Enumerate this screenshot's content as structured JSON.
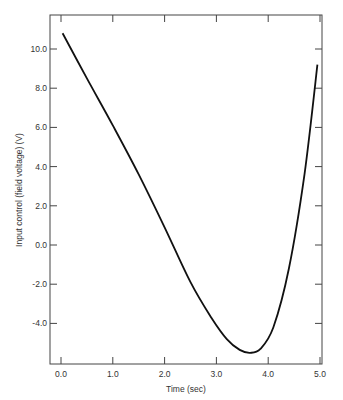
{
  "chart_data": {
    "type": "line",
    "title": "",
    "xlabel": "Time (sec)",
    "ylabel": "Input control (field voltage) (V)",
    "xlim": [
      0.0,
      5.0
    ],
    "ylim": [
      -6.2,
      11.6
    ],
    "x_ticks": [
      "0.0",
      "1.0",
      "2.0",
      "3.0",
      "4.0",
      "5.0"
    ],
    "y_ticks": [
      "10.0",
      "8.0",
      "6.0",
      "4.0",
      "2.0",
      "0.0",
      "-2.0",
      "-4.0"
    ],
    "grid": false,
    "legend": null,
    "series": [
      {
        "name": "Input control",
        "color": "#111111",
        "x": [
          0.03,
          0.5,
          1.0,
          1.5,
          2.0,
          2.5,
          2.9,
          3.2,
          3.45,
          3.65,
          3.85,
          4.1,
          4.4,
          4.7,
          4.95
        ],
        "y": [
          10.8,
          8.5,
          6.1,
          3.6,
          0.9,
          -1.9,
          -3.7,
          -4.8,
          -5.35,
          -5.5,
          -5.3,
          -4.2,
          -1.2,
          3.6,
          9.2
        ]
      }
    ]
  }
}
